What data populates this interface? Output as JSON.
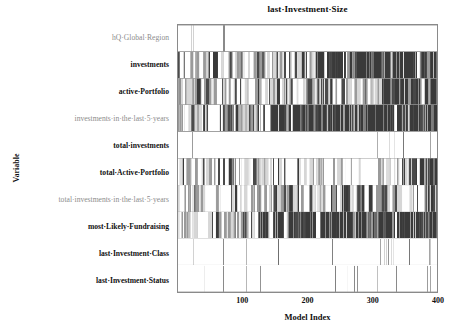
{
  "chart": {
    "title": "last·Investment·Size",
    "xlabel": "Model Index",
    "ylabel": "Variable"
  },
  "axes": {
    "x_ticks": [
      {
        "value": 100,
        "label": "100"
      },
      {
        "value": 200,
        "label": "200"
      },
      {
        "value": 300,
        "label": "300"
      },
      {
        "value": 400,
        "label": "400"
      }
    ],
    "y_categories": [
      {
        "label": "hQ·Global·Region",
        "emphasis": "muted"
      },
      {
        "label": "investments",
        "emphasis": "strong"
      },
      {
        "label": "active·Portfolio",
        "emphasis": "strong"
      },
      {
        "label": "investments·in·the·last·5·years",
        "emphasis": "muted"
      },
      {
        "label": "total·investments",
        "emphasis": "strong"
      },
      {
        "label": "total·Active·Portfolio",
        "emphasis": "strong"
      },
      {
        "label": "total·investments·in·the·last·5·years",
        "emphasis": "muted"
      },
      {
        "label": "most·Likely·Fundraising",
        "emphasis": "strong"
      },
      {
        "label": "last·Investment·Class",
        "emphasis": "strong"
      },
      {
        "label": "last·Investment·Status",
        "emphasis": "strong"
      }
    ]
  },
  "colors": {
    "frame": "#8a8a8a",
    "background": "#fdfdfd",
    "shade_white": "#ffffff",
    "shade_light": "#d6d6d6",
    "shade_mid": "#9a9a9a",
    "shade_dark": "#4a4a4a",
    "shade_darkest": "#3a3a3a",
    "text": "#101010",
    "text_muted": "#8c8c8c"
  },
  "chart_data": {
    "type": "heatmap",
    "title": "last·Investment·Size",
    "xlabel": "Model Index",
    "ylabel": "Variable",
    "xlim": [
      0,
      400
    ],
    "grid": false,
    "legend": "none",
    "categories": [
      "hQ·Global·Region",
      "investments",
      "active·Portfolio",
      "investments·in·the·last·5·years",
      "total·investments",
      "total·Active·Portfolio",
      "total·investments·in·the·last·5·years",
      "most·Likely·Fundraising",
      "last·Investment·Class",
      "last·Investment·Status"
    ],
    "shade_levels": [
      "#ffffff",
      "#d6d6d6",
      "#9a9a9a",
      "#4a4a4a",
      "#3a3a3a"
    ],
    "n_models": 400,
    "rows": [
      {
        "name": "hQ·Global·Region",
        "fill_density": 0.03,
        "seed": 11,
        "dark_from": 1.02,
        "base_level": 0,
        "sparse_marks": [
          20,
          23,
          70,
          71,
          401
        ]
      },
      {
        "name": "investments",
        "fill_density": 0.62,
        "seed": 27,
        "dark_from": 0.52,
        "base_level": 0,
        "sparse_marks": []
      },
      {
        "name": "active·Portfolio",
        "fill_density": 0.58,
        "seed": 43,
        "dark_from": 0.78,
        "base_level": 0,
        "sparse_marks": []
      },
      {
        "name": "investments·in·the·last·5·years",
        "fill_density": 0.66,
        "seed": 59,
        "dark_from": 0.36,
        "base_level": 0,
        "sparse_marks": []
      },
      {
        "name": "total·investments",
        "fill_density": 0.02,
        "seed": 71,
        "dark_from": 1.02,
        "base_level": 0,
        "sparse_marks": [
          22,
          308,
          326,
          333,
          348,
          389
        ]
      },
      {
        "name": "total·Active·Portfolio",
        "fill_density": 0.6,
        "seed": 89,
        "dark_from": 0.93,
        "base_level": 0,
        "sparse_marks": []
      },
      {
        "name": "total·investments·in·the·last·5·years",
        "fill_density": 0.57,
        "seed": 101,
        "dark_from": 0.95,
        "base_level": 0,
        "sparse_marks": []
      },
      {
        "name": "most·Likely·Fundraising",
        "fill_density": 0.64,
        "seed": 113,
        "dark_from": 0.3,
        "base_level": 0,
        "sparse_marks": []
      },
      {
        "name": "last·Investment·Class",
        "fill_density": 0.035,
        "seed": 131,
        "dark_from": 1.02,
        "base_level": 0,
        "sparse_marks": [
          23,
          70,
          106,
          155,
          238,
          313,
          318,
          321,
          325,
          329,
          332,
          357,
          388,
          390
        ]
      },
      {
        "name": "last·Investment·Status",
        "fill_density": 0.03,
        "seed": 149,
        "dark_from": 1.02,
        "base_level": 0,
        "sparse_marks": [
          40,
          70,
          105,
          127,
          243,
          253,
          262,
          272,
          277,
          307,
          337,
          385,
          389
        ]
      }
    ]
  }
}
